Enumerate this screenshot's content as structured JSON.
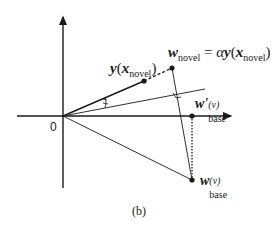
{
  "figure": {
    "caption": "(b)",
    "origin_label": "0",
    "labels": {
      "y_novel": {
        "main": "y",
        "open": "(",
        "arg": "x",
        "arg_sub": "novel",
        "close": ")"
      },
      "w_novel": {
        "main": "w",
        "sub": "novel",
        "eq": "=",
        "alpha": "α",
        "y": "y",
        "open": "(",
        "arg": "x",
        "arg_sub": "novel",
        "close": ")"
      },
      "w_prime_base": {
        "main": "w'",
        "sup": "(v)",
        "sub": "base"
      },
      "w_base": {
        "main": "w",
        "sup": "(v)",
        "sub": "base"
      }
    },
    "colors": {
      "stroke": "#1a1a1a",
      "background": "#ffffff"
    }
  }
}
